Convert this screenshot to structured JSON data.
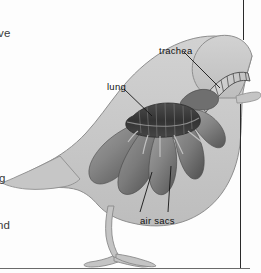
{
  "page": {
    "width": 261,
    "height": 273,
    "background_color": "#fdfdfd"
  },
  "figure": {
    "kind": "anatomical-diagram",
    "colors": {
      "body_fill": "#c9c9c9",
      "body_outline": "#8e8e8e",
      "air_sac_fill": "#8b8b8b",
      "air_sac_shadow": "#5e5e5e",
      "lung_fill": "#3c3c3c",
      "trachea_fill": "#d8d8d8",
      "trachea_outline": "#4a4a4a",
      "leader_line": "#1a1a1a",
      "rule_color": "#2a2a2a"
    }
  },
  "labels": {
    "trachea": "trachea",
    "lung": "lung",
    "air_sacs": "air sacs"
  },
  "margin_text": {
    "fragment_1": "ve",
    "fragment_2": "g",
    "fragment_3": "nd"
  },
  "icons": {
    "trachea_leader": "leader-line-icon",
    "lung_leader": "leader-line-icon",
    "air_sacs_leader_left": "leader-line-icon",
    "air_sacs_leader_right": "leader-line-icon"
  }
}
